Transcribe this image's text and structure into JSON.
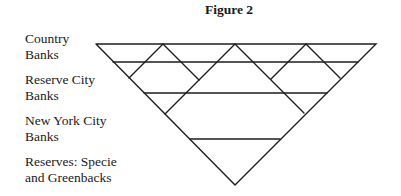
{
  "figure": {
    "title": "Figure 2"
  },
  "labels": [
    {
      "line1": "Country",
      "line2": "Banks"
    },
    {
      "line1": "Reserve City",
      "line2": "Banks"
    },
    {
      "line1": "New York City",
      "line2": "Banks"
    },
    {
      "line1": "Reserves: Specie",
      "line2": "and Greenbacks"
    }
  ],
  "diagram": {
    "type": "inverted-pyramid",
    "tiers_top_to_bottom": [
      "Country Banks",
      "Reserve City Banks",
      "New York City Banks",
      "Reserves: Specie and Greenbacks"
    ],
    "line_color": "#1e1e1e"
  }
}
